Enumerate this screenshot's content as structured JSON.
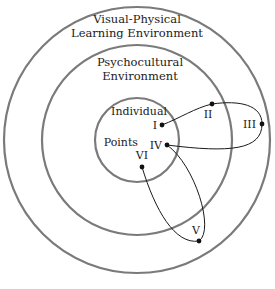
{
  "diagram": {
    "rings": [
      {
        "name": "outer",
        "label_lines": [
          "Visual-Physical",
          "Learning Environment"
        ]
      },
      {
        "name": "middle",
        "label_lines": [
          "Psychocultural",
          "Environment"
        ]
      },
      {
        "name": "inner",
        "label_lines": [
          "Individual",
          "Points"
        ]
      }
    ],
    "points": [
      {
        "id": "I",
        "label": "I"
      },
      {
        "id": "II",
        "label": "II"
      },
      {
        "id": "III",
        "label": "III"
      },
      {
        "id": "IV",
        "label": "IV"
      },
      {
        "id": "V",
        "label": "V"
      },
      {
        "id": "VI",
        "label": "VI"
      }
    ],
    "path_order": [
      "I",
      "II",
      "III",
      "IV",
      "V",
      "VI"
    ],
    "colors": {
      "ring": "#7a7a7a",
      "path": "#1a1a1a",
      "point": "#111111"
    }
  }
}
